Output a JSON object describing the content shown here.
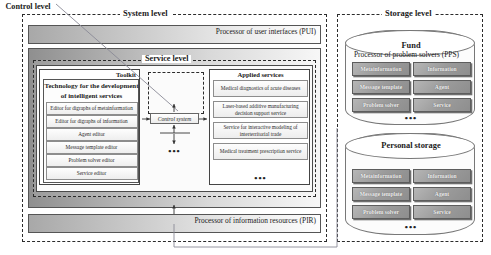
{
  "diagram": {
    "system": {
      "level_label": "System level",
      "pui_label": "Processor of user interfaces (PUI)",
      "pps_label": "Processor of problem solvers (PPS)",
      "pir_label": "Processor of information resources (PIR)",
      "service_level_label": "Service level"
    },
    "toolkit": {
      "header": "Toolkit",
      "title": "Technology for the development of intelligent services",
      "items": [
        "Editor for digraphs of metainformation",
        "Editor for digraphs of information",
        "Agent editor",
        "Message template editor",
        "Problem solver editor",
        "Service editor"
      ]
    },
    "control": {
      "label": "Control level",
      "system_box": "Control system",
      "dots": "•••"
    },
    "applied": {
      "header": "Applied services",
      "items": [
        "Medical diagnostics of acute diseases",
        "Laser-based additive manufacturing decision support service",
        "Service for interactive modeling of interterritorial trade",
        "Medical treatment prescription service"
      ],
      "dots": "•••"
    },
    "storage": {
      "level_label": "Storage level",
      "fund": {
        "title": "Fund",
        "items": [
          "Metainformation",
          "Information",
          "Message template",
          "Agent",
          "Problem solver",
          "Service"
        ],
        "dots": "•••"
      },
      "personal": {
        "title": "Personal storage",
        "items": [
          "Metainformation",
          "Information",
          "Message template",
          "Agent",
          "Problem solver",
          "Service"
        ],
        "dots": "•••"
      }
    },
    "colors": {
      "frame": "#2b2b2b",
      "band_dark": "#8f8f8f",
      "band_light": "#fdfdfd",
      "storage_box": "#9b9b9b"
    }
  }
}
